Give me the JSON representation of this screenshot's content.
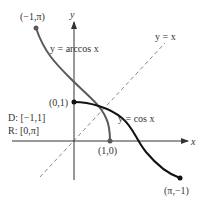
{
  "axes": {
    "x_label": "x",
    "y_label": "y"
  },
  "curves": {
    "arccos": {
      "label": "y = arccos x",
      "color": "#5a5a5a"
    },
    "cos": {
      "label": "y = cos x",
      "color": "#111111"
    },
    "identity": {
      "label": "y = x",
      "color": "#6a6a6a",
      "style": "dashed"
    }
  },
  "points": {
    "arccos_start": "(−1,π)",
    "arccos_end": "(1,0)",
    "cos_start": "(0,1)",
    "cos_end": "(π,−1)"
  },
  "domain_range": {
    "domain": "D: [−1,1]",
    "range": "R: [0,π]"
  }
}
